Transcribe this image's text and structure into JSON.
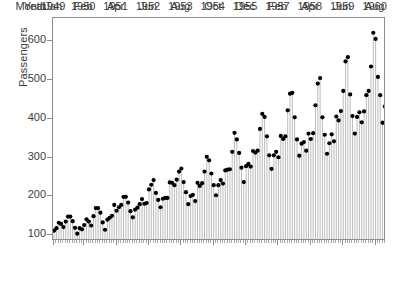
{
  "chart_data": {
    "type": "bar",
    "title": "",
    "subtitle": "",
    "xlabel": "",
    "ylabel": "Passengers",
    "ylim": [
      85,
      660
    ],
    "yticks": [
      100,
      200,
      300,
      400,
      500,
      600
    ],
    "ytick_labels": [
      "100",
      "200",
      "300",
      "400",
      "500",
      "600"
    ],
    "grid": false,
    "legend": null,
    "marker": "filled-circle",
    "marker_color": "#000000",
    "stem_color": "#b4b4b4",
    "frame_color": "#8d8d8d",
    "x_axis_rows": [
      {
        "header": "Month",
        "labels": [
          "Jan",
          "Feb",
          "Apr",
          "Jun",
          "Aug",
          "Oct",
          "Dec",
          "Feb",
          "Apr",
          "Jun",
          "Aug"
        ]
      },
      {
        "header": "Year",
        "labels": [
          "1949",
          "1950",
          "1951",
          "1952",
          "1953",
          "1954",
          "1955",
          "1957",
          "1958",
          "1959",
          "1960"
        ]
      }
    ],
    "x_tick_indices": [
      0,
      13,
      27,
      41,
      55,
      69,
      83,
      97,
      111,
      125,
      139
    ],
    "categories": [
      "Jan 1949",
      "Feb 1949",
      "Mar 1949",
      "Apr 1949",
      "May 1949",
      "Jun 1949",
      "Jul 1949",
      "Aug 1949",
      "Sep 1949",
      "Oct 1949",
      "Nov 1949",
      "Dec 1949",
      "Jan 1950",
      "Feb 1950",
      "Mar 1950",
      "Apr 1950",
      "May 1950",
      "Jun 1950",
      "Jul 1950",
      "Aug 1950",
      "Sep 1950",
      "Oct 1950",
      "Nov 1950",
      "Dec 1950",
      "Jan 1951",
      "Feb 1951",
      "Mar 1951",
      "Apr 1951",
      "May 1951",
      "Jun 1951",
      "Jul 1951",
      "Aug 1951",
      "Sep 1951",
      "Oct 1951",
      "Nov 1951",
      "Dec 1951",
      "Jan 1952",
      "Feb 1952",
      "Mar 1952",
      "Apr 1952",
      "May 1952",
      "Jun 1952",
      "Jul 1952",
      "Aug 1952",
      "Sep 1952",
      "Oct 1952",
      "Nov 1952",
      "Dec 1952",
      "Jan 1953",
      "Feb 1953",
      "Mar 1953",
      "Apr 1953",
      "May 1953",
      "Jun 1953",
      "Jul 1953",
      "Aug 1953",
      "Sep 1953",
      "Oct 1953",
      "Nov 1953",
      "Dec 1953",
      "Jan 1954",
      "Feb 1954",
      "Mar 1954",
      "Apr 1954",
      "May 1954",
      "Jun 1954",
      "Jul 1954",
      "Aug 1954",
      "Sep 1954",
      "Oct 1954",
      "Nov 1954",
      "Dec 1954",
      "Jan 1955",
      "Feb 1955",
      "Mar 1955",
      "Apr 1955",
      "May 1955",
      "Jun 1955",
      "Jul 1955",
      "Aug 1955",
      "Sep 1955",
      "Oct 1955",
      "Nov 1955",
      "Dec 1955",
      "Jan 1956",
      "Feb 1956",
      "Mar 1956",
      "Apr 1956",
      "May 1956",
      "Jun 1956",
      "Jul 1956",
      "Aug 1956",
      "Sep 1956",
      "Oct 1956",
      "Nov 1956",
      "Dec 1956",
      "Jan 1957",
      "Feb 1957",
      "Mar 1957",
      "Apr 1957",
      "May 1957",
      "Jun 1957",
      "Jul 1957",
      "Aug 1957",
      "Sep 1957",
      "Oct 1957",
      "Nov 1957",
      "Dec 1957",
      "Jan 1958",
      "Feb 1958",
      "Mar 1958",
      "Apr 1958",
      "May 1958",
      "Jun 1958",
      "Jul 1958",
      "Aug 1958",
      "Sep 1958",
      "Oct 1958",
      "Nov 1958",
      "Dec 1958",
      "Jan 1959",
      "Feb 1959",
      "Mar 1959",
      "Apr 1959",
      "May 1959",
      "Jun 1959",
      "Jul 1959",
      "Aug 1959",
      "Sep 1959",
      "Oct 1959",
      "Nov 1959",
      "Dec 1959",
      "Jan 1960",
      "Feb 1960",
      "Mar 1960",
      "Apr 1960",
      "May 1960",
      "Jun 1960",
      "Jul 1960",
      "Aug 1960",
      "Sep 1960",
      "Oct 1960",
      "Nov 1960",
      "Dec 1960"
    ],
    "values": [
      112,
      118,
      132,
      129,
      121,
      135,
      148,
      148,
      136,
      119,
      104,
      118,
      115,
      126,
      141,
      135,
      125,
      149,
      170,
      170,
      158,
      133,
      114,
      140,
      145,
      150,
      178,
      163,
      172,
      178,
      199,
      199,
      184,
      162,
      146,
      166,
      171,
      180,
      193,
      181,
      183,
      218,
      230,
      242,
      209,
      191,
      172,
      194,
      196,
      196,
      236,
      235,
      229,
      243,
      264,
      272,
      237,
      211,
      180,
      201,
      204,
      188,
      235,
      227,
      234,
      264,
      302,
      293,
      259,
      229,
      203,
      229,
      242,
      233,
      267,
      269,
      270,
      315,
      364,
      347,
      312,
      274,
      237,
      278,
      284,
      277,
      317,
      313,
      318,
      374,
      413,
      405,
      355,
      306,
      271,
      306,
      315,
      301,
      356,
      348,
      355,
      422,
      465,
      467,
      404,
      347,
      305,
      336,
      340,
      318,
      362,
      348,
      363,
      435,
      491,
      505,
      404,
      359,
      310,
      337,
      360,
      342,
      406,
      396,
      420,
      472,
      548,
      559,
      463,
      407,
      362,
      405,
      417,
      391,
      419,
      461,
      472,
      535,
      622,
      606,
      508,
      461,
      390,
      432
    ]
  }
}
